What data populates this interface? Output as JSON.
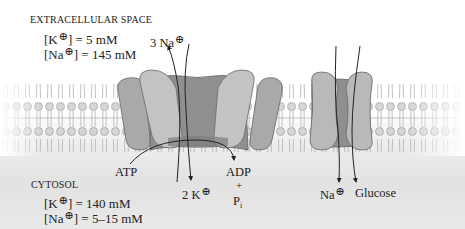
{
  "figure": {
    "type": "cell membrane transport diagram",
    "colors": {
      "background": "#ffffff",
      "cytosol_shade": "#e4e4e4",
      "membrane_head": "#c9c9c9",
      "membrane_tail": "#e6e6e6",
      "protein_light": "#bdbdbd",
      "protein_mid": "#a3a3a3",
      "protein_dark": "#8a8a8a",
      "arrow": "#222222"
    }
  },
  "extracellular": {
    "title": "EXTRACELLULAR SPACE",
    "k_label": "[K",
    "k_value": "] = 5 mM",
    "na_label": "[Na",
    "na_value": "] = 145 mM"
  },
  "cytosol": {
    "title": "CYTOSOL",
    "k_label": "[K",
    "k_value": "] = 140 mM",
    "na_label": "[Na",
    "na_value": "] = 5–15 mM"
  },
  "pump": {
    "name": "Na+/K+ ATPase",
    "na_out": "3 Na",
    "k_in": "2 K",
    "atp": "ATP",
    "adp": "ADP",
    "plus": "+",
    "pi": "P",
    "pi_sub": "i"
  },
  "symporter": {
    "name": "Na+/glucose symporter",
    "na_in": "Na",
    "glucose": "Glucose"
  },
  "symbols": {
    "cation": "⊕"
  }
}
